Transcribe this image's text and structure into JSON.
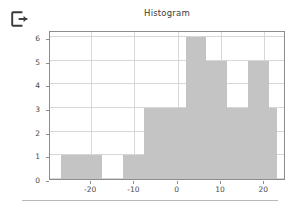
{
  "app": {
    "icon_name": "exit-logout-icon"
  },
  "chart_data": {
    "type": "bar",
    "title": "Histogram",
    "xlabel": "",
    "ylabel": "",
    "grid": true,
    "legend": "none",
    "xlim": [
      -29.5,
      25.0
    ],
    "ylim": [
      0,
      6.3
    ],
    "xticks": [
      "-20",
      "-10",
      "0",
      "10",
      "20"
    ],
    "xtick_values": [
      -20,
      -10,
      0,
      10,
      20
    ],
    "yticks": [
      "0",
      "1",
      "2",
      "3",
      "4",
      "5",
      "6"
    ],
    "ytick_values": [
      0,
      1,
      2,
      3,
      4,
      5,
      6
    ],
    "bin_edges": [
      -27.0,
      -22.2,
      -17.4,
      -12.6,
      -7.8,
      -3.0,
      1.8,
      6.6,
      11.4,
      16.2,
      21.0,
      23.0
    ],
    "bars": [
      {
        "label": "-27.0 to -22.2",
        "x0": -27.0,
        "x1": -22.2,
        "value": 1
      },
      {
        "label": "-22.2 to -17.4",
        "x0": -22.2,
        "x1": -17.4,
        "value": 1
      },
      {
        "label": "-17.4 to -12.6",
        "x0": -17.4,
        "x1": -12.6,
        "value": 0
      },
      {
        "label": "-12.6 to -7.8",
        "x0": -12.6,
        "x1": -7.8,
        "value": 1
      },
      {
        "label": "-7.8 to -3.0",
        "x0": -7.8,
        "x1": -3.0,
        "value": 3
      },
      {
        "label": "-3.0 to 1.8",
        "x0": -3.0,
        "x1": 1.8,
        "value": 3
      },
      {
        "label": "1.8 to 6.6",
        "x0": 1.8,
        "x1": 6.6,
        "value": 6
      },
      {
        "label": "6.6 to 11.4",
        "x0": 6.6,
        "x1": 11.4,
        "value": 5
      },
      {
        "label": "11.4 to 16.2",
        "x0": 11.4,
        "x1": 16.2,
        "value": 3
      },
      {
        "label": "16.2 to 21.0",
        "x0": 16.2,
        "x1": 21.0,
        "value": 5
      },
      {
        "label": "21.0 to 23.0",
        "x0": 21.0,
        "x1": 23.0,
        "value": 3
      }
    ],
    "values": [
      1,
      1,
      0,
      1,
      3,
      3,
      6,
      5,
      3,
      5,
      3
    ],
    "colors": {
      "bar_fill": "#c4c4c4",
      "grid": "#d7d7d7",
      "axis": "#8d8d8d",
      "text": "#4a4a4a",
      "title": "#3b3b3b",
      "background": "#ffffff"
    }
  }
}
